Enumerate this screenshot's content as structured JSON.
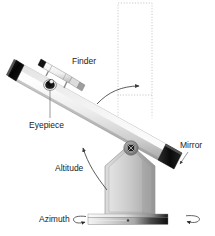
{
  "figure": {
    "background_color": "#ffffff",
    "width": 215,
    "height": 236
  },
  "labels": {
    "finder": "Finder",
    "eyepiece": "Eyepiece",
    "mirror": "Mirror",
    "altitude": "Altitude",
    "azimuth": "Azimuth"
  },
  "parts": {
    "tube": {
      "name": "optical-tube",
      "gradient_from": "#ffffff",
      "gradient_to": "#b4b4b4"
    },
    "aperture_end": {
      "name": "tube-open-end",
      "color": "#101010"
    },
    "mirror_end": {
      "name": "primary-mirror-end",
      "color": "#121212"
    },
    "finder_scope": {
      "name": "finder-scope",
      "color": "#e8e8e8"
    },
    "eyepiece_barrel": {
      "name": "eyepiece",
      "color": "#1a1a1a"
    },
    "mount": {
      "name": "altazimuth-mount-body",
      "gradient_from": "#d8d8d8",
      "gradient_to": "#9a9a9a"
    },
    "pivot": {
      "name": "altitude-pivot-hub",
      "color": "#3a3a3a"
    },
    "base_bar": {
      "name": "azimuth-base",
      "gradient_from": "#f2f2f2",
      "gradient_to": "#101010"
    },
    "guide_box": {
      "name": "vertical-reference-guide",
      "style": "dotted",
      "color": "#b0b0b0"
    }
  },
  "annotations": {
    "altitude_arc": {
      "name": "altitude-rotation-arrow",
      "meaning": "vertical tilt of the tube"
    },
    "azimuth_arc": {
      "name": "azimuth-rotation-arrow",
      "meaning": "horizontal rotation of the base"
    },
    "sweep_arrow": {
      "name": "tube-sweep-arrow",
      "meaning": "tube swings toward vertical"
    }
  },
  "colors": {
    "line": "#555555",
    "text": "#222222",
    "leader": "#666666"
  }
}
